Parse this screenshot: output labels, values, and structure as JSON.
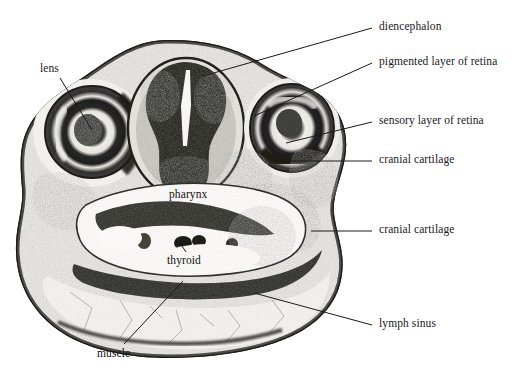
{
  "figure": {
    "kind": "histological-cross-section",
    "background_color": "#ffffff",
    "ink_color": "#1a1a1a"
  },
  "labels": {
    "lens": "lens",
    "diencephalon": "diencephalon",
    "pigmented_layer": "pigmented layer of retina",
    "sensory_layer": "sensory layer of retina",
    "cranial_cartilage_upper": "cranial cartilage",
    "cranial_cartilage_lower": "cranial cartilage",
    "lymph_sinus": "lymph sinus",
    "pharynx": "pharynx",
    "thyroid": "thyroid",
    "muscle": "muscle"
  }
}
